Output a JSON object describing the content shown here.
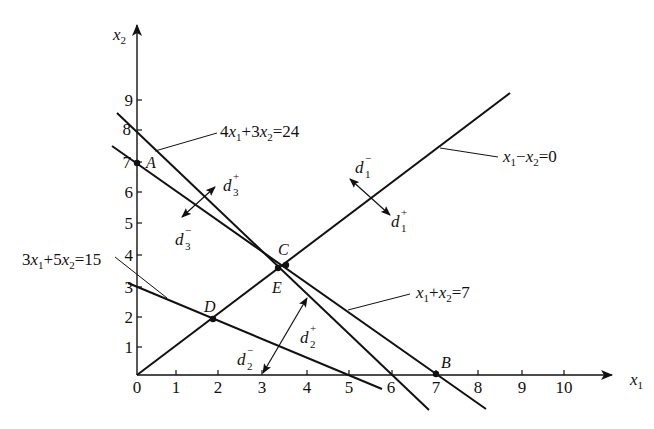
{
  "colors": {
    "ink": "#111111",
    "background": "#ffffff"
  },
  "axes": {
    "x": {
      "var": "x",
      "sub": "1",
      "ticks": [
        "0",
        "1",
        "2",
        "3",
        "4",
        "5",
        "6",
        "7",
        "8",
        "9",
        "10"
      ]
    },
    "y": {
      "var": "x",
      "sub": "2",
      "ticks": [
        "1",
        "2",
        "3",
        "4",
        "5",
        "6",
        "7",
        "8",
        "9"
      ]
    }
  },
  "lines": [
    {
      "equation": "4x1+3x2=24",
      "parts": [
        "4",
        "x",
        "1",
        "+3",
        "x",
        "2",
        "=24"
      ]
    },
    {
      "equation": "x1-x2=0",
      "parts": [
        "x",
        "1",
        "−",
        "x",
        "2",
        "=0"
      ]
    },
    {
      "equation": "x1+x2=7",
      "parts": [
        "x",
        "1",
        "+",
        "x",
        "2",
        "=7"
      ]
    },
    {
      "equation": "3x1+5x2=15",
      "parts": [
        "3",
        "x",
        "1",
        "+5",
        "x",
        "2",
        "=15"
      ]
    }
  ],
  "points": {
    "A": "A",
    "B": "B",
    "C": "C",
    "D": "D",
    "E": "E"
  },
  "deviations": {
    "d1_minus": {
      "base": "d",
      "sub": "1",
      "sup": "−"
    },
    "d1_plus": {
      "base": "d",
      "sub": "1",
      "sup": "+"
    },
    "d2_minus": {
      "base": "d",
      "sub": "2",
      "sup": "−"
    },
    "d2_plus": {
      "base": "d",
      "sub": "2",
      "sup": "+"
    },
    "d3_minus": {
      "base": "d",
      "sub": "3",
      "sup": "−"
    },
    "d3_plus": {
      "base": "d",
      "sub": "3",
      "sup": "+"
    }
  }
}
